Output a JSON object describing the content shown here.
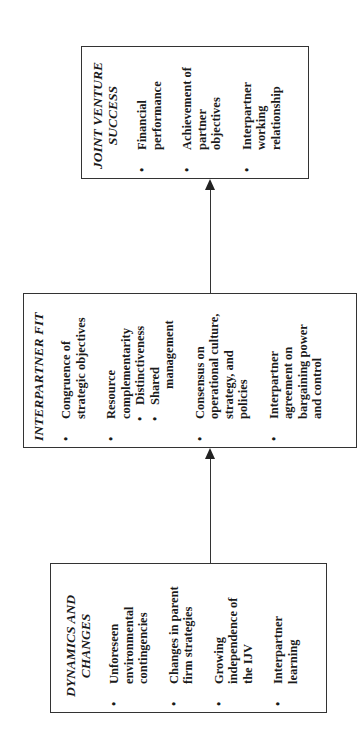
{
  "diagram": {
    "orientation": "rotated-90-ccw",
    "boxes": [
      {
        "id": "joint-venture-success",
        "title_line1": "JOINT VENTURE",
        "title_line2": "SUCCESS",
        "items": [
          {
            "lines": [
              "Financial",
              "performance"
            ]
          },
          {
            "lines": [
              "Achievement of",
              "partner",
              "objectives"
            ]
          },
          {
            "lines": [
              "Interpartner",
              "working",
              "relationship"
            ]
          }
        ]
      },
      {
        "id": "interpartner-fit",
        "title_line1": "INTERPARTNER FIT",
        "items": [
          {
            "lines": [
              "Congruence of",
              "strategic objectives"
            ]
          },
          {
            "lines": [
              "Resource",
              "complementarity"
            ],
            "subitems": [
              {
                "lines": [
                  "Distinctiveness"
                ]
              },
              {
                "lines": [
                  "Shared",
                  "management"
                ]
              }
            ]
          },
          {
            "lines": [
              "Consensus on",
              "operational culture,",
              "strategy, and",
              "policies"
            ]
          },
          {
            "lines": [
              "Interpartner",
              "agreement on",
              "bargaining power",
              "and control"
            ]
          }
        ]
      },
      {
        "id": "dynamics-and-changes",
        "title_line1": "DYNAMICS AND",
        "title_line2": "CHANGES",
        "items": [
          {
            "lines": [
              "Unforeseen",
              "environmental",
              "contingencies"
            ]
          },
          {
            "lines": [
              "Changes in parent",
              "firm strategies"
            ]
          },
          {
            "lines": [
              "Growing",
              "independence of",
              "the IJV"
            ]
          },
          {
            "lines": [
              "Interpartner",
              "learning"
            ]
          }
        ]
      }
    ],
    "arrows": [
      {
        "from": "dynamics-and-changes",
        "to": "interpartner-fit"
      },
      {
        "from": "interpartner-fit",
        "to": "joint-venture-success"
      }
    ],
    "bullet_glyph": "•"
  }
}
